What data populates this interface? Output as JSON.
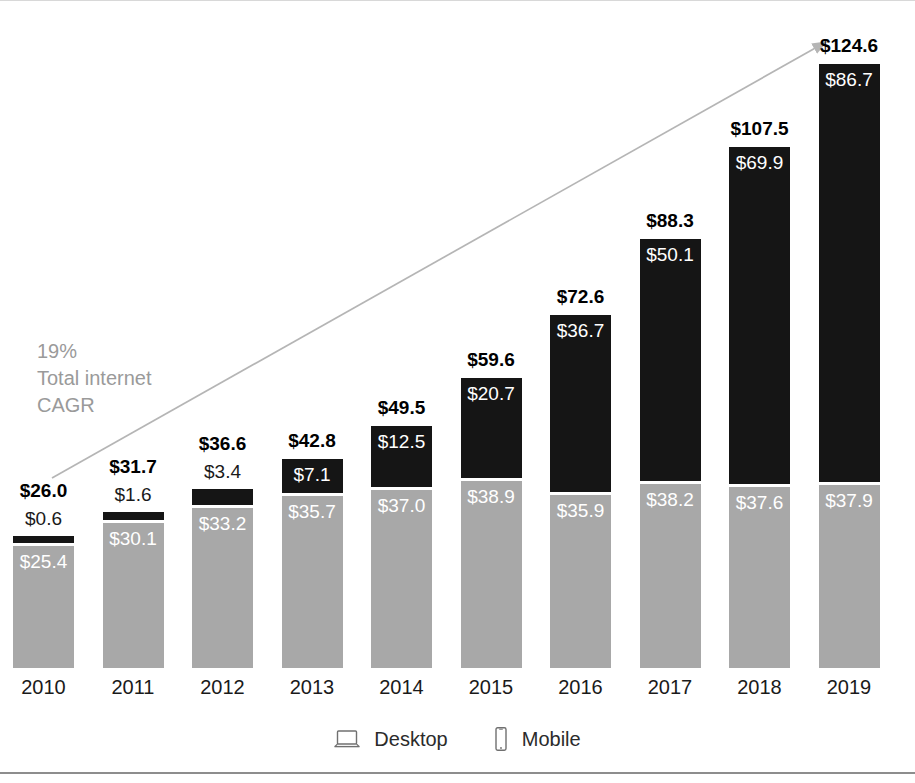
{
  "chart_data": {
    "type": "bar",
    "subtype": "stacked-bar",
    "title": "",
    "xlabel": "",
    "ylabel": "",
    "grid": false,
    "ylim": [
      0,
      124.6
    ],
    "categories": [
      "2010",
      "2011",
      "2012",
      "2013",
      "2014",
      "2015",
      "2016",
      "2017",
      "2018",
      "2019"
    ],
    "series": [
      {
        "name": "Desktop",
        "color": "#a8a8a8",
        "values": [
          25.4,
          30.1,
          33.2,
          35.7,
          37.0,
          38.9,
          35.9,
          38.2,
          37.6,
          37.9
        ],
        "labels": [
          "$25.4",
          "$30.1",
          "$33.2",
          "$35.7",
          "$37.0",
          "$38.9",
          "$35.9",
          "$38.2",
          "$37.6",
          "$37.9"
        ]
      },
      {
        "name": "Mobile",
        "color": "#151515",
        "values": [
          0.6,
          1.6,
          3.4,
          7.1,
          12.5,
          20.7,
          36.7,
          50.1,
          69.9,
          86.7
        ],
        "labels": [
          "$0.6",
          "$1.6",
          "$3.4",
          "$7.1",
          "$12.5",
          "$20.7",
          "$36.7",
          "$50.1",
          "$69.9",
          "$86.7"
        ]
      }
    ],
    "totals": [
      26.0,
      31.7,
      36.6,
      42.8,
      49.5,
      59.6,
      72.6,
      88.3,
      107.5,
      124.6
    ],
    "total_labels": [
      "$26.0",
      "$31.7",
      "$36.6",
      "$42.8",
      "$49.5",
      "$59.6",
      "$72.6",
      "$88.3",
      "$107.5",
      "$124.6"
    ],
    "legend": {
      "position": "bottom",
      "entries": [
        {
          "label": "Desktop",
          "icon": "laptop-icon",
          "color": "#a8a8a8"
        },
        {
          "label": "Mobile",
          "icon": "smartphone-icon",
          "color": "#151515"
        }
      ]
    },
    "annotations": [
      {
        "name": "cagr-note",
        "lines": [
          "19%",
          "Total internet",
          "CAGR"
        ],
        "color": "#9a9a9a"
      },
      {
        "name": "trend-arrow",
        "from": [
          52,
          478
        ],
        "to": [
          833,
          38
        ],
        "color": "#b5b5b5"
      }
    ]
  },
  "colors": {
    "desktop": "#a8a8a8",
    "mobile": "#151515",
    "annotation": "#9a9a9a",
    "arrow": "#b5b5b5",
    "rule": "#8d8d8d",
    "text": "#1a1a1a"
  }
}
